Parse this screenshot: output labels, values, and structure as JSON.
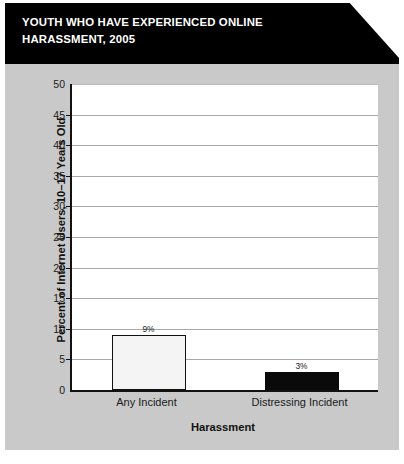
{
  "figure": {
    "title_lines": [
      "YOUTH WHO HAVE EXPERIENCED ONLINE",
      "HARASSMENT, 2005"
    ],
    "title_full": "YOUTH WHO HAVE EXPERIENCED ONLINE HARASSMENT, 2005",
    "panel_background": "#c9c9c9",
    "banner_background": "#000000",
    "banner_text_color": "#ffffff"
  },
  "chart_data": {
    "type": "bar",
    "title": "YOUTH WHO HAVE EXPERIENCED ONLINE HARASSMENT, 2005",
    "categories": [
      "Any Incident",
      "Distressing Incident"
    ],
    "values": [
      9,
      3
    ],
    "value_labels": [
      "9%",
      "3%"
    ],
    "series": [
      {
        "name": "Percent of Internet Users, 10–17 Years Old",
        "values": [
          9,
          3
        ]
      }
    ],
    "bar_styles": [
      "outline",
      "solid"
    ],
    "bar_colors": [
      "#f4f4f4",
      "#0a0a0a"
    ],
    "bar_edge_color": "#111111",
    "xlabel": "Harassment",
    "ylabel": "Percent of Internet Users, 10–17 Years Old",
    "ylim": [
      0,
      50
    ],
    "ytick_labels": [
      "0",
      "5",
      "10",
      "15",
      "20",
      "25",
      "30",
      "35",
      "40",
      "45",
      "50"
    ],
    "ytick_values": [
      0,
      5,
      10,
      15,
      20,
      25,
      30,
      35,
      40,
      45,
      50
    ],
    "grid": true,
    "grid_color": "#a8a8a8",
    "legend": false,
    "legend_position": "none",
    "plot_background": "#ffffff"
  }
}
